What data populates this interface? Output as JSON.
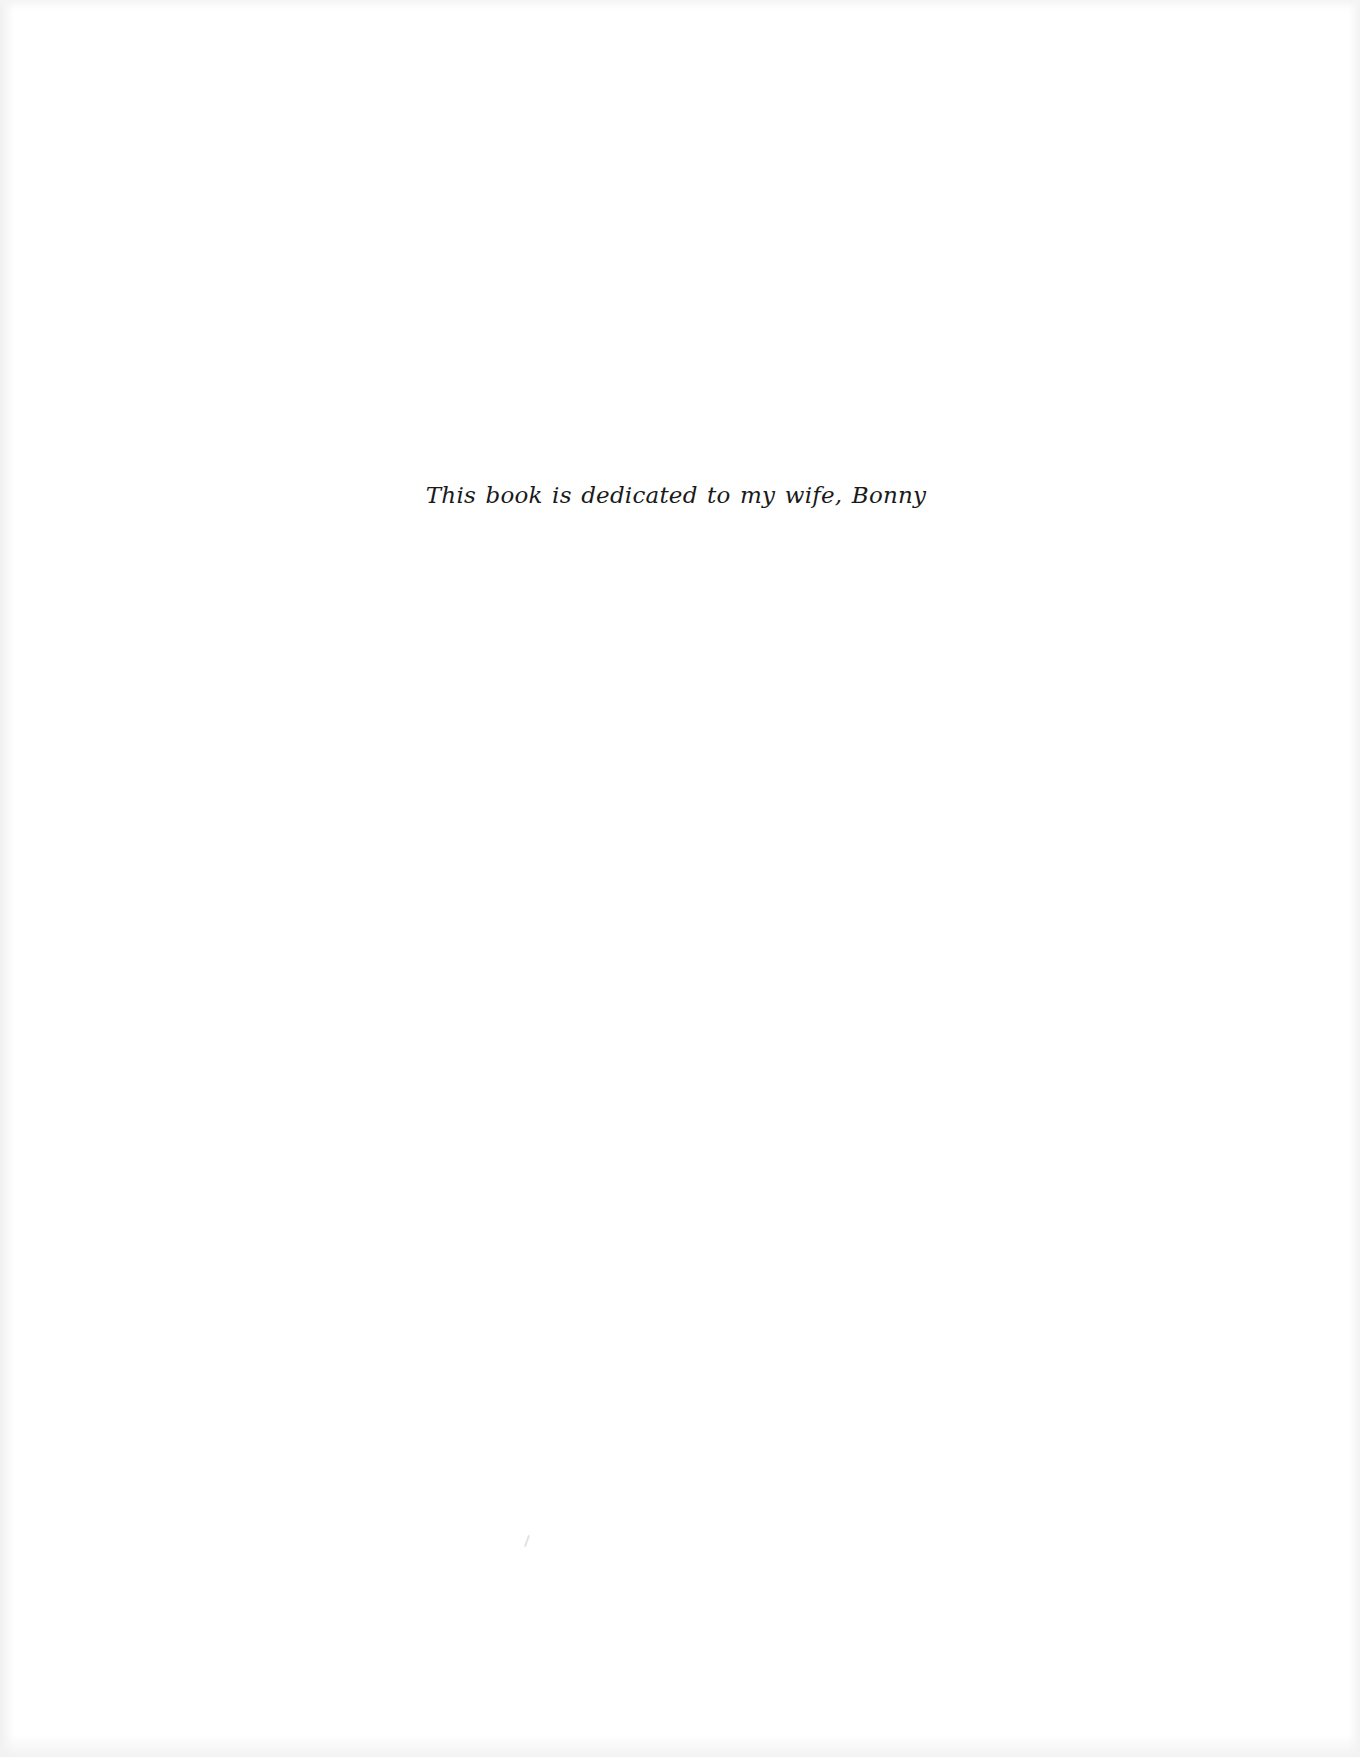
{
  "page": {
    "type": "dedication",
    "background_color": "#ffffff",
    "text_color": "#1a1a1a"
  },
  "dedication": {
    "text": "This book is dedicated to my wife, Bonny"
  }
}
